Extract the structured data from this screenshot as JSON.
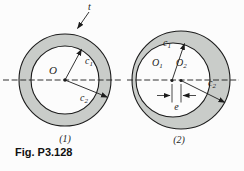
{
  "figure": {
    "caption": "Fig. P3.128",
    "colors": {
      "ring_fill": "#c9ccc9",
      "background": "#fcfcfc",
      "line": "#1c1c1c"
    },
    "left": {
      "number_label": "(1)",
      "thickness_label": "t",
      "center_label": "O",
      "inner_radius_label": {
        "base": "c",
        "sub": "1"
      },
      "outer_radius_label": {
        "base": "c",
        "sub": "2"
      }
    },
    "right": {
      "number_label": "(2)",
      "center1_label": {
        "base": "O",
        "sub": "1"
      },
      "center2_label": {
        "base": "O",
        "sub": "2"
      },
      "inner_radius_label": {
        "base": "c",
        "sub": "1"
      },
      "outer_radius_label": {
        "base": "c",
        "sub": "2"
      },
      "eccentricity_label": "e"
    }
  }
}
